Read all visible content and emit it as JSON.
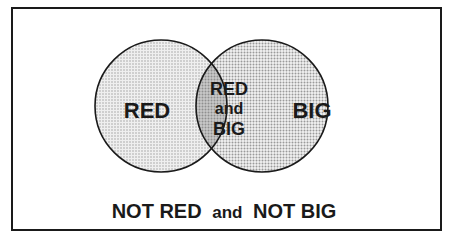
{
  "diagram": {
    "type": "venn",
    "sets": [
      {
        "id": "red",
        "label": "RED"
      },
      {
        "id": "big",
        "label": "BIG"
      }
    ],
    "intersection": {
      "line1": "RED",
      "line2": "and",
      "line3": "BIG"
    },
    "outside": {
      "part1": "NOT RED",
      "part2": "and",
      "part3": "NOT BIG"
    },
    "colors": {
      "frame": "#1a1a1a",
      "left_fill": "#e2e2e2",
      "right_fill": "#d6d6d6",
      "overlap_fill": "#a8a8a8",
      "background": "#ffffff"
    }
  }
}
